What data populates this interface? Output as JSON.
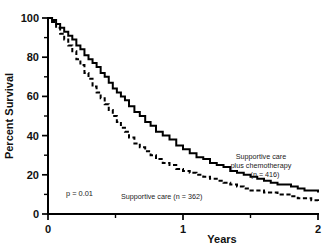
{
  "chart_data": {
    "type": "line",
    "title": "",
    "subtitle": "",
    "xlabel": "Years",
    "ylabel": "Percent Survival",
    "xlim": [
      0,
      2
    ],
    "ylim": [
      0,
      100
    ],
    "grid": false,
    "legend_position": "inline-annotations",
    "x_ticks_major": [
      0,
      1,
      2
    ],
    "x_tick_labels": [
      "0",
      "1",
      "2"
    ],
    "x_ticks_minor": [
      0.5,
      1.5
    ],
    "y_ticks_major": [
      0,
      20,
      40,
      60,
      80,
      100
    ],
    "y_tick_labels": [
      "0",
      "20",
      "40",
      "60",
      "80",
      "100"
    ],
    "y_ticks_minor": [
      10,
      30,
      50,
      70,
      90
    ],
    "annotations": [
      {
        "name": "p-value",
        "text": "p = 0.01"
      },
      {
        "name": "solid-curve-label-line1",
        "text": "Supportive care"
      },
      {
        "name": "solid-curve-label-line2",
        "text": "plus chemotherapy"
      },
      {
        "name": "solid-curve-label-line3",
        "text": "(n = 416)"
      },
      {
        "name": "dashed-curve-label",
        "text": "Supportive care (n = 362)"
      }
    ],
    "series": [
      {
        "name": "Supportive care plus chemotherapy",
        "n": 416,
        "style": "solid",
        "x": [
          0,
          0.03,
          0.06,
          0.09,
          0.12,
          0.15,
          0.18,
          0.21,
          0.24,
          0.27,
          0.3,
          0.33,
          0.36,
          0.39,
          0.42,
          0.45,
          0.48,
          0.51,
          0.54,
          0.57,
          0.6,
          0.64,
          0.68,
          0.72,
          0.76,
          0.8,
          0.85,
          0.9,
          0.95,
          1.0,
          1.05,
          1.1,
          1.15,
          1.2,
          1.25,
          1.3,
          1.35,
          1.4,
          1.45,
          1.5,
          1.55,
          1.6,
          1.65,
          1.7,
          1.75,
          1.8,
          1.85,
          1.9,
          1.95,
          2.0
        ],
        "y": [
          100,
          99,
          97,
          95,
          93,
          91,
          89,
          86,
          84,
          81,
          79,
          77,
          75,
          72,
          70,
          67,
          64,
          62,
          60,
          58,
          55,
          52,
          50,
          47,
          45,
          42,
          40,
          38,
          35,
          33,
          31,
          29,
          28,
          26,
          25,
          24,
          22,
          21,
          20,
          19,
          18,
          17,
          16,
          15,
          15,
          14,
          13,
          12,
          12,
          11
        ]
      },
      {
        "name": "Supportive care",
        "n": 362,
        "style": "dashed",
        "x": [
          0,
          0.03,
          0.06,
          0.09,
          0.12,
          0.15,
          0.18,
          0.21,
          0.24,
          0.27,
          0.3,
          0.33,
          0.36,
          0.39,
          0.42,
          0.45,
          0.48,
          0.51,
          0.54,
          0.57,
          0.6,
          0.64,
          0.68,
          0.72,
          0.76,
          0.8,
          0.85,
          0.9,
          0.95,
          1.0,
          1.05,
          1.1,
          1.15,
          1.2,
          1.25,
          1.3,
          1.35,
          1.4,
          1.45,
          1.5,
          1.55,
          1.6,
          1.65,
          1.7,
          1.75,
          1.8,
          1.85,
          1.9,
          1.95,
          2.0
        ],
        "y": [
          100,
          98,
          95,
          92,
          89,
          86,
          83,
          79,
          76,
          72,
          69,
          65,
          62,
          59,
          56,
          53,
          50,
          47,
          44,
          42,
          39,
          36,
          34,
          32,
          30,
          28,
          26,
          25,
          23,
          22,
          21,
          20,
          19,
          18,
          17,
          16,
          15,
          14,
          13,
          12,
          12,
          11,
          11,
          10,
          10,
          9,
          8,
          8,
          7,
          6
        ]
      }
    ]
  },
  "axes_geometry": {
    "origin_x": 48,
    "origin_y": 214,
    "right_x": 318,
    "top_y": 18
  }
}
